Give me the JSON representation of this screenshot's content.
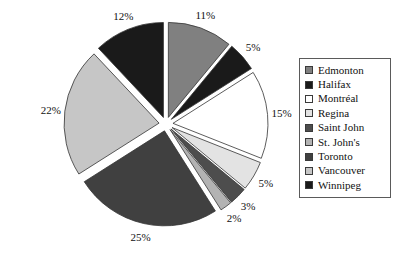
{
  "chart_data": {
    "type": "pie",
    "title": "",
    "subtitle": "",
    "exploded": true,
    "legend_position": "right",
    "grid": false,
    "categories": [
      "Edmonton",
      "Halifax",
      "Montréal",
      "Regina",
      "Saint John",
      "St. John's",
      "Toronto",
      "Vancouver",
      "Winnipeg"
    ],
    "values": [
      11,
      5,
      15,
      5,
      3,
      2,
      25,
      22,
      12
    ],
    "value_labels": [
      "11%",
      "5%",
      "15%",
      "5%",
      "3%",
      "2%",
      "25%",
      "22%",
      "12%"
    ],
    "unit": "%",
    "colors": [
      "#808080",
      "#1a1a1a",
      "#ffffff",
      "#e3e3e3",
      "#4d4d4d",
      "#b3b3b3",
      "#404040",
      "#c6c6c6",
      "#1a1a1a"
    ],
    "slice_border": "#333333"
  },
  "legend": {
    "items": [
      {
        "label": "Edmonton",
        "color": "#808080"
      },
      {
        "label": "Halifax",
        "color": "#1a1a1a"
      },
      {
        "label": "Montréal",
        "color": "#ffffff"
      },
      {
        "label": "Regina",
        "color": "#e3e3e3"
      },
      {
        "label": "Saint John",
        "color": "#4d4d4d"
      },
      {
        "label": "St. John's",
        "color": "#b3b3b3"
      },
      {
        "label": "Toronto",
        "color": "#404040"
      },
      {
        "label": "Vancouver",
        "color": "#c6c6c6"
      },
      {
        "label": "Winnipeg",
        "color": "#1a1a1a"
      }
    ]
  },
  "geometry": {
    "center_x": 166,
    "center_y": 124,
    "radius": 95,
    "explode": 7,
    "start_angle_deg": -90,
    "label_radius": 116
  }
}
